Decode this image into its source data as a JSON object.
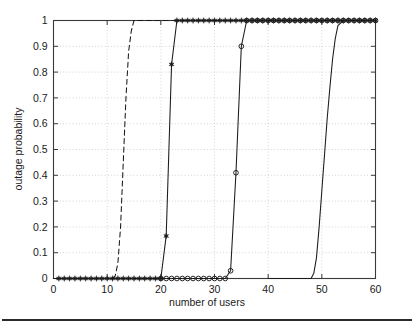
{
  "figure": {
    "background_color": "#ffffff",
    "axis_color": "#3a3a3a",
    "grid_color": "#c8c8c8",
    "series_color": "#1a1a1a",
    "bottom_rule_color": "#2b2b2b"
  },
  "chart_data": {
    "type": "line",
    "title": "",
    "subtitle": "",
    "xlabel": "number of users",
    "ylabel": "outage probability",
    "xlim": [
      0,
      60
    ],
    "ylim": [
      0,
      1
    ],
    "xticks": [
      0,
      10,
      20,
      30,
      40,
      50,
      60
    ],
    "xtick_labels": [
      "0",
      "10",
      "20",
      "30",
      "40",
      "50",
      "60"
    ],
    "yticks": [
      0,
      0.1,
      0.2,
      0.3,
      0.4,
      0.5,
      0.6,
      0.7,
      0.8,
      0.9,
      1
    ],
    "ytick_labels": [
      "0",
      "0.1",
      "0.2",
      "0.3",
      "0.4",
      "0.5",
      "0.6",
      "0.7",
      "0.8",
      "0.9",
      "1"
    ],
    "grid": true,
    "grid_style": "dotted",
    "legend": null,
    "legend_position": "none",
    "annotations": [],
    "series": [
      {
        "name": "curve-1",
        "line_style": "dashed",
        "marker": "none",
        "x": [
          0,
          8,
          10,
          11,
          11.5,
          12,
          12.5,
          13,
          13.5,
          14,
          14.5,
          15,
          16,
          20,
          30,
          40,
          50,
          60
        ],
        "y": [
          0,
          0,
          0,
          0,
          0.01,
          0.06,
          0.2,
          0.45,
          0.7,
          0.88,
          0.96,
          1,
          1,
          1,
          1,
          1,
          1,
          1
        ]
      },
      {
        "name": "curve-2",
        "line_style": "solid",
        "marker": "star-filled",
        "x": [
          1,
          2,
          3,
          4,
          5,
          6,
          7,
          8,
          9,
          10,
          11,
          12,
          13,
          14,
          15,
          16,
          17,
          18,
          19,
          20,
          21,
          22,
          23,
          24,
          25,
          26,
          27,
          28,
          29,
          30,
          31,
          32,
          33,
          34,
          35,
          36,
          37,
          38,
          39,
          40,
          41,
          42,
          43,
          44,
          45,
          46,
          47,
          48,
          49,
          50,
          51,
          52,
          53,
          54,
          55,
          56,
          57,
          58,
          59,
          60
        ],
        "y": [
          0,
          0,
          0,
          0,
          0,
          0,
          0,
          0,
          0,
          0,
          0,
          0,
          0,
          0,
          0,
          0,
          0,
          0,
          0,
          0,
          0.165,
          0.83,
          1,
          1,
          1,
          1,
          1,
          1,
          1,
          1,
          1,
          1,
          1,
          1,
          1,
          1,
          1,
          1,
          1,
          1,
          1,
          1,
          1,
          1,
          1,
          1,
          1,
          1,
          1,
          1,
          1,
          1,
          1,
          1,
          1,
          1,
          1,
          1,
          1,
          1
        ]
      },
      {
        "name": "curve-3",
        "line_style": "solid",
        "marker": "circle-open",
        "x": [
          20,
          21,
          22,
          23,
          24,
          25,
          26,
          27,
          28,
          29,
          30,
          31,
          32,
          33,
          34,
          35,
          36,
          37,
          38,
          39,
          40,
          41,
          42,
          43,
          44,
          45,
          46,
          47,
          48,
          49,
          50,
          51,
          52,
          53,
          54,
          55,
          56,
          57,
          58,
          59,
          60
        ],
        "y": [
          0,
          0,
          0,
          0,
          0,
          0,
          0,
          0,
          0,
          0,
          0,
          0,
          0,
          0.03,
          0.41,
          0.9,
          1,
          1,
          1,
          1,
          1,
          1,
          1,
          1,
          1,
          1,
          1,
          1,
          1,
          1,
          1,
          1,
          1,
          1,
          1,
          1,
          1,
          1,
          1,
          1,
          1
        ]
      },
      {
        "name": "curve-4",
        "line_style": "solid",
        "marker": "none",
        "x": [
          40,
          46,
          48,
          48.5,
          49,
          49.5,
          50,
          50.5,
          51,
          51.5,
          52,
          52.5,
          53,
          54,
          56,
          58,
          60
        ],
        "y": [
          0,
          0,
          0,
          0.02,
          0.08,
          0.2,
          0.34,
          0.48,
          0.62,
          0.74,
          0.85,
          0.93,
          0.98,
          1,
          1,
          1,
          1
        ]
      }
    ]
  }
}
